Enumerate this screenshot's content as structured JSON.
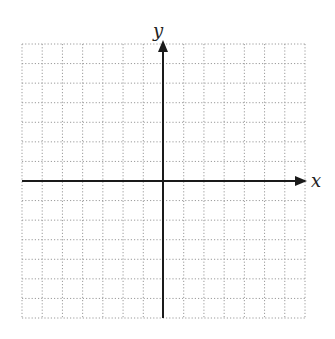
{
  "diagram": {
    "type": "coordinate-plane",
    "grid": {
      "columns": 14,
      "rows": 14,
      "left": 22,
      "top": 44,
      "right": 305,
      "bottom": 318,
      "line_style": "dotted",
      "line_color": "#9a9a9a"
    },
    "axes": {
      "x_label": "x",
      "y_label": "y",
      "origin_px": [
        163,
        181
      ],
      "color": "#1a1a1a",
      "x_arrow_direction": "right",
      "y_arrow_direction": "up"
    }
  }
}
